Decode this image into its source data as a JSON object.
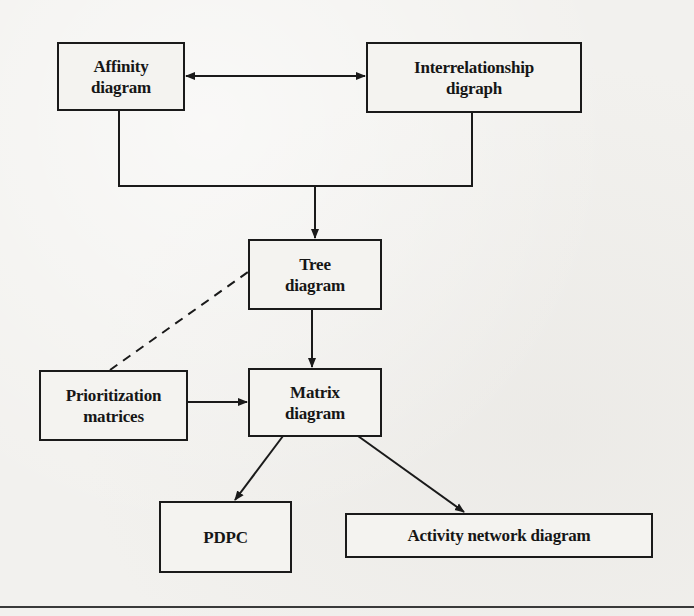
{
  "diagram": {
    "nodes": {
      "affinity": {
        "label": "Affinity\ndiagram"
      },
      "interrelationship": {
        "label": "Interrelationship\ndigraph"
      },
      "tree": {
        "label": "Tree\ndiagram"
      },
      "prioritization": {
        "label": "Prioritization\nmatrices"
      },
      "matrix": {
        "label": "Matrix\ndiagram"
      },
      "pdpc": {
        "label": "PDPC"
      },
      "activity": {
        "label": "Activity network diagram"
      }
    },
    "edges": [
      {
        "from": "affinity",
        "to": "interrelationship",
        "style": "solid",
        "arrow": "both"
      },
      {
        "from": "affinity",
        "to": "tree",
        "style": "solid",
        "arrow": "end",
        "note": "joined bracket"
      },
      {
        "from": "interrelationship",
        "to": "tree",
        "style": "solid",
        "arrow": "end",
        "note": "joined bracket"
      },
      {
        "from": "prioritization",
        "to": "tree",
        "style": "dashed",
        "arrow": "none"
      },
      {
        "from": "tree",
        "to": "matrix",
        "style": "solid",
        "arrow": "end"
      },
      {
        "from": "prioritization",
        "to": "matrix",
        "style": "solid",
        "arrow": "end"
      },
      {
        "from": "matrix",
        "to": "pdpc",
        "style": "solid",
        "arrow": "end"
      },
      {
        "from": "matrix",
        "to": "activity",
        "style": "solid",
        "arrow": "end"
      }
    ],
    "colors": {
      "line": "#1a1a1a",
      "box_fill": "#f4f3f0",
      "paper": "#f2f1ee"
    }
  }
}
